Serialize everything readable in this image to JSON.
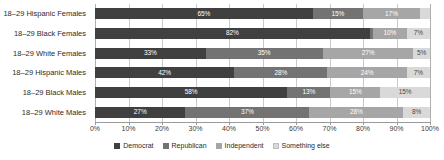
{
  "chart_data": {
    "type": "bar",
    "orientation": "horizontal",
    "stacked": true,
    "normalized_percent": true,
    "title": "",
    "xlabel": "",
    "ylabel": "",
    "xlim": [
      0,
      100
    ],
    "grid": true,
    "legend_position": "bottom",
    "categories": [
      "18–29 Hispanic Females",
      "18–29 Black Females",
      "18–29 White Females",
      "18–29 Hispanic Males",
      "18–29 Black Males",
      "18–29 White Males"
    ],
    "series": [
      {
        "name": "Democrat",
        "color": "#404040",
        "values": [
          65,
          82,
          33,
          42,
          58,
          27
        ]
      },
      {
        "name": "Republican",
        "color": "#737373",
        "values": [
          15,
          1,
          35,
          28,
          13,
          37
        ]
      },
      {
        "name": "Independent",
        "color": "#a6a6a6",
        "values": [
          17,
          10,
          27,
          24,
          15,
          28
        ]
      },
      {
        "name": "Something else",
        "color": "#d9d9d9",
        "values": [
          3,
          7,
          5,
          7,
          15,
          8
        ]
      }
    ],
    "bar_labels": [
      [
        "65%",
        "15%",
        "17%",
        "3%"
      ],
      [
        "82%",
        "1%",
        "10%",
        "7%"
      ],
      [
        "33%",
        "35%",
        "27%",
        "5%"
      ],
      [
        "42%",
        "28%",
        "24%",
        "7%"
      ],
      [
        "58%",
        "13%",
        "15%",
        "15%"
      ],
      [
        "27%",
        "37%",
        "28%",
        "8%"
      ]
    ],
    "xticks": [
      "0%",
      "10%",
      "20%",
      "30%",
      "40%",
      "50%",
      "60%",
      "70%",
      "80%",
      "90%",
      "100%"
    ],
    "xtick_values": [
      0,
      10,
      20,
      30,
      40,
      50,
      60,
      70,
      80,
      90,
      100
    ]
  }
}
